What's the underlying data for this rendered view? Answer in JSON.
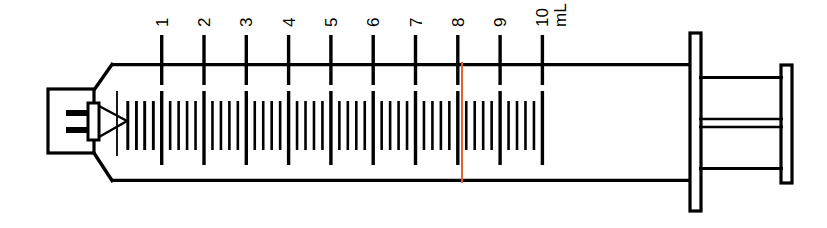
{
  "figure": {
    "type": "line-drawing",
    "background_color": "#ffffff",
    "ink_color": "#000000",
    "indicator_color": "#ea5c33"
  },
  "syringe": {
    "capacity_value": "10",
    "capacity_unit": "mL",
    "unit_label": "mL",
    "parts": {
      "tip_label": "luer-tip",
      "collar_label": "luer-collar",
      "taper_label": "barrel-taper",
      "barrel_label": "barrel",
      "plunger_rod_label": "plunger-rod",
      "thumb_flange_label": "thumb-flange",
      "finger_flange_label": "finger-flange"
    }
  },
  "scale": {
    "unit": "mL",
    "major_interval": 1,
    "minor_interval": 0.2,
    "min": 0,
    "max": 10,
    "major_labels": [
      "1",
      "2",
      "3",
      "4",
      "5",
      "6",
      "7",
      "8",
      "9",
      "10"
    ],
    "major_values": [
      1,
      2,
      3,
      4,
      5,
      6,
      7,
      8,
      9,
      10
    ],
    "label_orientation": "rotated-90-ccw",
    "minor_ticks_per_interval": 4
  },
  "indicator": {
    "name": "volume-indicator-line",
    "value": 8.1,
    "unit": "mL",
    "color": "#ea5c33",
    "orientation": "vertical"
  },
  "geometry": {
    "barrel_top_y": 63,
    "barrel_bottom_y": 182,
    "barrel_left_x": 112,
    "barrel_right_x": 700,
    "tick_origin_x": 161.7,
    "tick_spacing_x": 42.3
  },
  "chart_data": {
    "type": "scale",
    "xlabel": "mL",
    "ylabel": "",
    "categories": [
      "1",
      "2",
      "3",
      "4",
      "5",
      "6",
      "7",
      "8",
      "9",
      "10"
    ],
    "values": [
      1,
      2,
      3,
      4,
      5,
      6,
      7,
      8,
      9,
      10
    ],
    "xlim": [
      0,
      10
    ],
    "grid": false,
    "legend": "none",
    "annotations": [
      {
        "label": "mL",
        "value": 10,
        "kind": "unit-label"
      },
      {
        "label": "indicator",
        "value": 8.1,
        "kind": "red-line",
        "color": "#ea5c33"
      }
    ]
  }
}
